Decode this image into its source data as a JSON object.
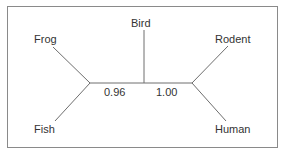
{
  "diagram": {
    "type": "unrooted phylogenetic tree",
    "line_color": "#6e6e6e",
    "text_color": "#333333",
    "border_color": "#8a8a8a",
    "taxa": {
      "frog": "Frog",
      "fish": "Fish",
      "bird": "Bird",
      "rodent": "Rodent",
      "human": "Human"
    },
    "branch_support": {
      "left_internal": "0.96",
      "right_internal": "1.00"
    }
  }
}
